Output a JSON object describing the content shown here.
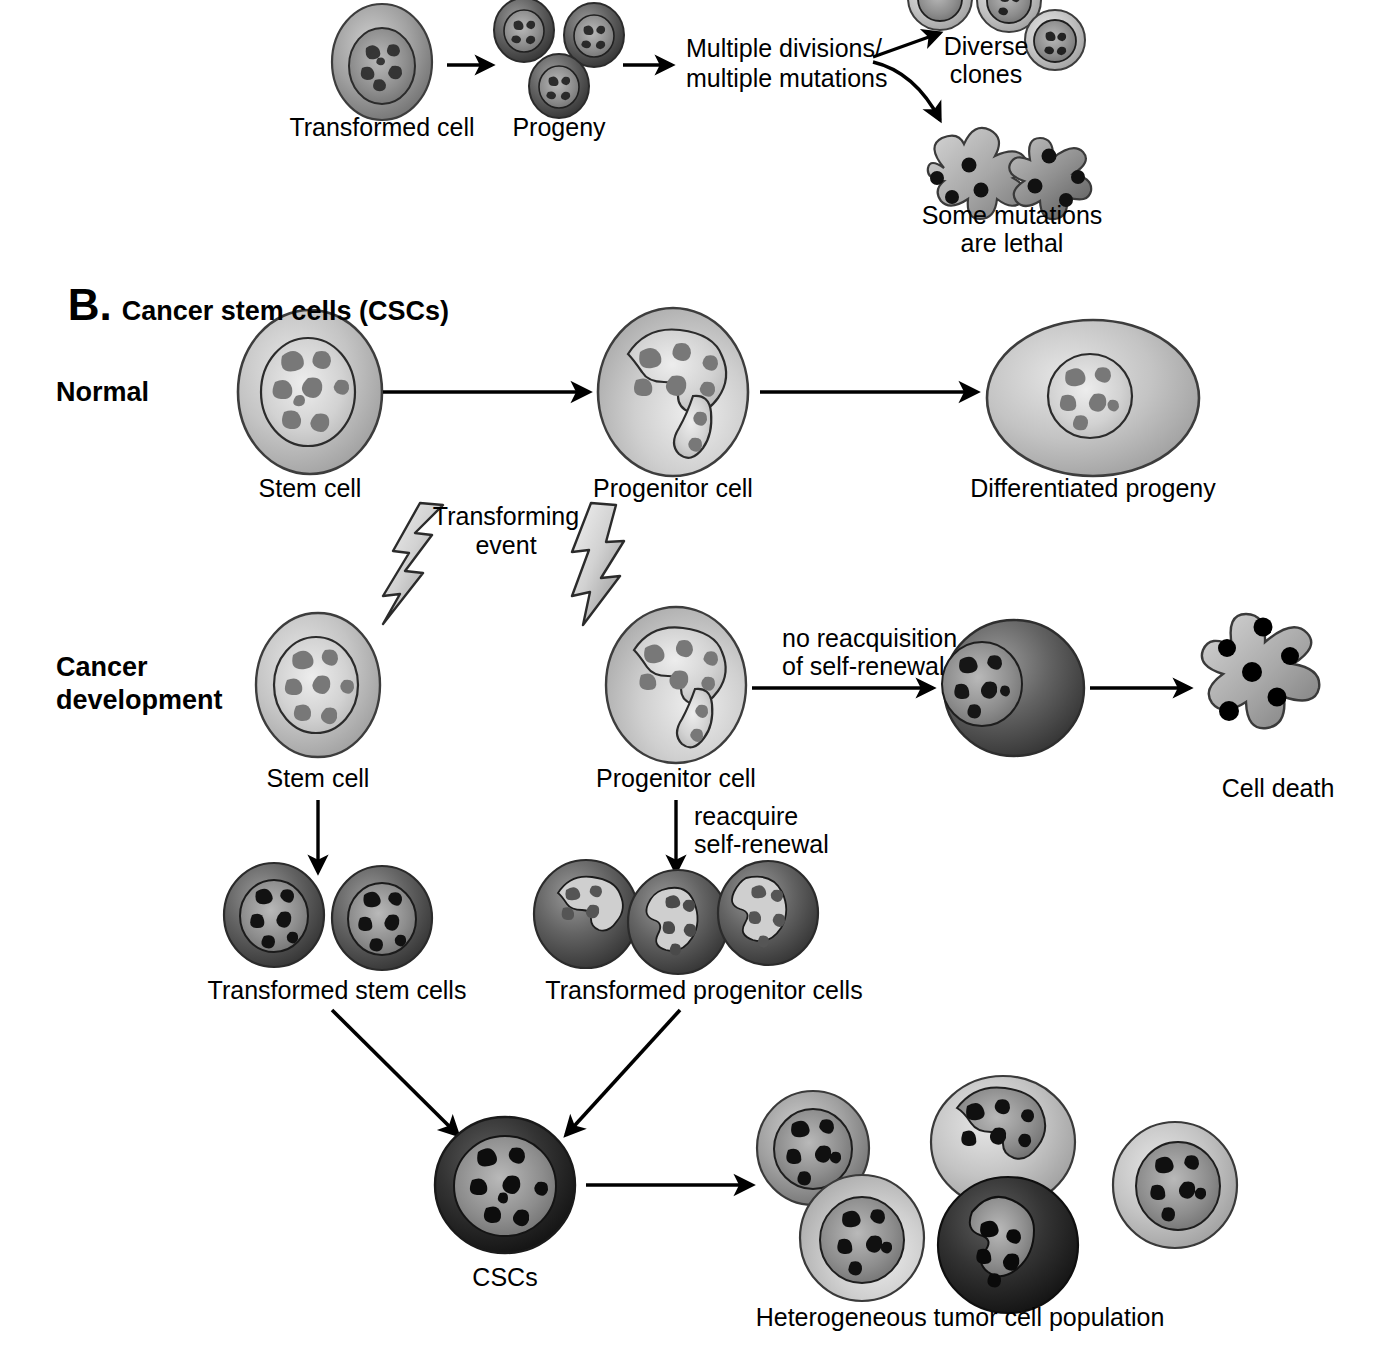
{
  "figure": {
    "panels": [
      {
        "id": "A",
        "letter": "",
        "title": "",
        "labels": {
          "transformed_cell": "Transformed cell",
          "progeny": "Progeny",
          "multiple_divisions_line1": "Multiple divisions/",
          "multiple_divisions_line2": "multiple mutations",
          "diverse_line1": "Diverse",
          "diverse_line2": "clones",
          "lethal_line1": "Some mutations",
          "lethal_line2": "are lethal"
        }
      },
      {
        "id": "B",
        "letter": "B.",
        "title": "Cancer stem cells (CSCs)",
        "rows": {
          "normal": "Normal",
          "cancer_line1": "Cancer",
          "cancer_line2": "development"
        },
        "labels": {
          "stem_cell_normal": "Stem cell",
          "progenitor_cell_normal": "Progenitor cell",
          "differentiated_progeny": "Differentiated progeny",
          "transforming_line1": "Transforming",
          "transforming_line2": "event",
          "stem_cell_cancer": "Stem cell",
          "progenitor_cell_cancer": "Progenitor cell",
          "no_reacq_line1": "no reacquisition",
          "no_reacq_line2": "of self-renewal",
          "cell_death": "Cell death",
          "reacquire_line1": "reacquire",
          "reacquire_line2": "self-renewal",
          "transformed_stem_cells": "Transformed stem cells",
          "transformed_progenitor_cells": "Transformed progenitor cells",
          "cscs": "CSCs",
          "heterogeneous": "Heterogeneous tumor cell population"
        }
      }
    ]
  },
  "colors": {
    "ink": "#000000",
    "background": "#ffffff",
    "cytoplasm_light": "#c9c9c9",
    "cytoplasm_mid": "#a8a8a8",
    "cytoplasm_dark": "#6e6e6e",
    "cytoplasm_verydark": "#3a3a3a",
    "nucleus_light": "#d6d6d6",
    "nucleus_mid": "#9a9a9a",
    "nucleus_dark": "#4a4a4a",
    "chromatin": "#6b6b6b",
    "bolt_fill": "#d8d8d8"
  }
}
